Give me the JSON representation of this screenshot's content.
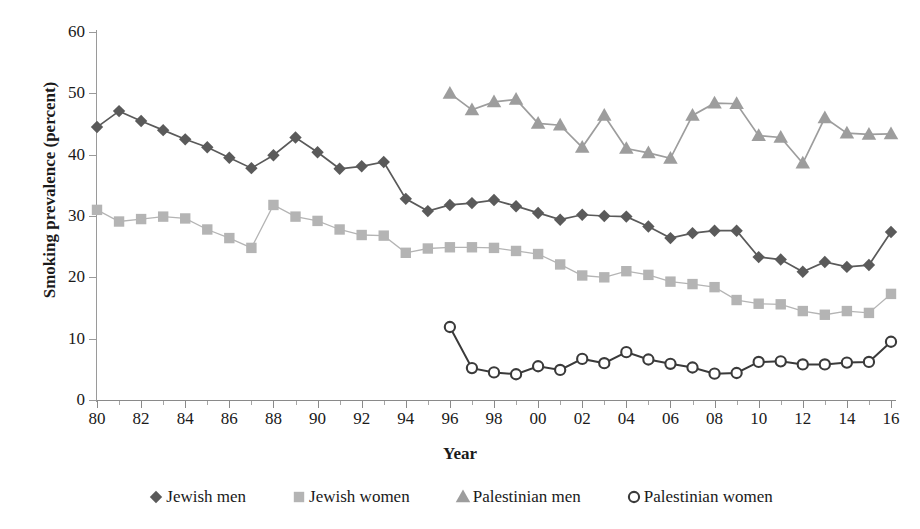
{
  "chart_data": {
    "type": "line",
    "title": "",
    "xlabel": "Year",
    "ylabel": "Smoking prevalence (percent)",
    "xlim": [
      1980,
      2016
    ],
    "ylim": [
      0,
      60
    ],
    "yticks": [
      0,
      10,
      20,
      30,
      40,
      50,
      60
    ],
    "xticks": [
      1980,
      1982,
      1984,
      1986,
      1988,
      1990,
      1992,
      1994,
      1996,
      1998,
      2000,
      2002,
      2004,
      2006,
      2008,
      2010,
      2012,
      2014,
      2016
    ],
    "xtick_labels": [
      "80",
      "82",
      "84",
      "86",
      "88",
      "90",
      "92",
      "94",
      "96",
      "98",
      "00",
      "02",
      "04",
      "06",
      "08",
      "10",
      "12",
      "14",
      "16"
    ],
    "grid": false,
    "legend_position": "bottom",
    "series": [
      {
        "name": "Jewish men",
        "marker": "diamond",
        "color": "#5a5a5a",
        "x": [
          1980,
          1981,
          1982,
          1983,
          1984,
          1985,
          1986,
          1987,
          1988,
          1989,
          1990,
          1991,
          1992,
          1993,
          1994,
          1995,
          1996,
          1997,
          1998,
          1999,
          2000,
          2001,
          2002,
          2003,
          2004,
          2005,
          2006,
          2007,
          2008,
          2009,
          2010,
          2011,
          2012,
          2013,
          2014,
          2015,
          2016
        ],
        "values": [
          44.5,
          47.1,
          45.5,
          44.0,
          42.5,
          41.2,
          39.5,
          37.8,
          39.9,
          42.8,
          40.4,
          37.7,
          38.1,
          38.8,
          32.8,
          30.8,
          31.8,
          32.1,
          32.6,
          31.6,
          30.5,
          29.4,
          30.2,
          30.0,
          29.9,
          28.3,
          26.4,
          27.2,
          27.6,
          27.6,
          23.3,
          22.9,
          20.9,
          22.5,
          21.7,
          22.0,
          27.4
        ]
      },
      {
        "name": "Jewish women",
        "marker": "square",
        "color": "#b4b4b4",
        "x": [
          1980,
          1981,
          1982,
          1983,
          1984,
          1985,
          1986,
          1987,
          1988,
          1989,
          1990,
          1991,
          1992,
          1993,
          1994,
          1995,
          1996,
          1997,
          1998,
          1999,
          2000,
          2001,
          2002,
          2003,
          2004,
          2005,
          2006,
          2007,
          2008,
          2009,
          2010,
          2011,
          2012,
          2013,
          2014,
          2015,
          2016
        ],
        "values": [
          31.0,
          29.1,
          29.5,
          29.9,
          29.6,
          27.8,
          26.4,
          24.8,
          31.8,
          29.9,
          29.2,
          27.8,
          26.9,
          26.8,
          24.0,
          24.7,
          24.9,
          24.9,
          24.8,
          24.3,
          23.8,
          22.1,
          20.3,
          20.0,
          21.0,
          20.4,
          19.3,
          18.9,
          18.4,
          16.3,
          15.7,
          15.6,
          14.5,
          13.9,
          14.5,
          14.2,
          17.3
        ]
      },
      {
        "name": "Palestinian men",
        "marker": "triangle",
        "color": "#9d9d9d",
        "x": [
          1996,
          1997,
          1998,
          1999,
          2000,
          2001,
          2002,
          2003,
          2004,
          2005,
          2006,
          2007,
          2008,
          2009,
          2010,
          2011,
          2012,
          2013,
          2014,
          2015,
          2016
        ],
        "values": [
          50.0,
          47.3,
          48.6,
          49.0,
          45.1,
          44.8,
          41.2,
          46.4,
          41.0,
          40.3,
          39.4,
          46.4,
          48.4,
          48.3,
          43.1,
          42.8,
          38.6,
          46.0,
          43.5,
          43.3,
          43.4
        ]
      },
      {
        "name": "Palestinian women",
        "marker": "circle",
        "color": "#3a3a3a",
        "x": [
          1996,
          1997,
          1998,
          1999,
          2000,
          2001,
          2002,
          2003,
          2004,
          2005,
          2006,
          2007,
          2008,
          2009,
          2010,
          2011,
          2012,
          2013,
          2014,
          2015,
          2016
        ],
        "values": [
          11.9,
          5.2,
          4.5,
          4.2,
          5.5,
          4.9,
          6.7,
          6.0,
          7.8,
          6.6,
          5.9,
          5.3,
          4.3,
          4.4,
          6.2,
          6.3,
          5.8,
          5.8,
          6.1,
          6.2,
          9.5
        ]
      }
    ]
  },
  "axis": {
    "y_title": "Smoking prevalence (percent)",
    "x_title": "Year",
    "y_labels": [
      "60",
      "50",
      "40",
      "30",
      "20",
      "10",
      "0"
    ]
  },
  "legend": {
    "items": [
      {
        "label": "Jewish men",
        "marker": "diamond-marker-icon",
        "color": "#5a5a5a"
      },
      {
        "label": "Jewish women",
        "marker": "square-marker-icon",
        "color": "#b4b4b4"
      },
      {
        "label": "Palestinian men",
        "marker": "triangle-marker-icon",
        "color": "#9d9d9d"
      },
      {
        "label": "Palestinian women",
        "marker": "circle-marker-icon",
        "color": "#3a3a3a"
      }
    ]
  }
}
